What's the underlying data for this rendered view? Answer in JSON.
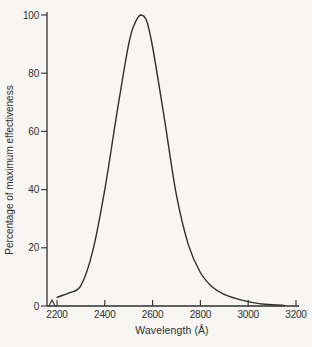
{
  "figure": {
    "ink_color": "#2f2f2f",
    "paper_color": "#f7f6f3"
  },
  "chart_data": {
    "type": "line",
    "title": "",
    "xlabel": "Wavelength (Å)",
    "ylabel": "Percentage of maximum effectiveness",
    "xlim": [
      2200,
      3200
    ],
    "ylim": [
      0,
      100
    ],
    "xticks": [
      "2200",
      "2400",
      "2600",
      "2800",
      "3000",
      "3200"
    ],
    "yticks": [
      "0",
      "20",
      "40",
      "60",
      "80",
      "100"
    ],
    "grid": false,
    "legend_position": "none",
    "axis_break_before_first_xtick": true,
    "series": [
      {
        "name": "relative germicidal effectiveness",
        "x": [
          2200,
          2250,
          2300,
          2350,
          2400,
          2450,
          2500,
          2525,
          2550,
          2575,
          2600,
          2650,
          2700,
          2750,
          2800,
          2850,
          2900,
          2950,
          3000,
          3050,
          3100,
          3150
        ],
        "y": [
          3,
          4.5,
          7,
          19,
          40,
          66,
          90,
          97,
          100,
          98,
          89,
          64,
          38,
          21,
          11.5,
          6.5,
          4,
          2.5,
          1.5,
          0.8,
          0.4,
          0.2
        ]
      }
    ]
  }
}
